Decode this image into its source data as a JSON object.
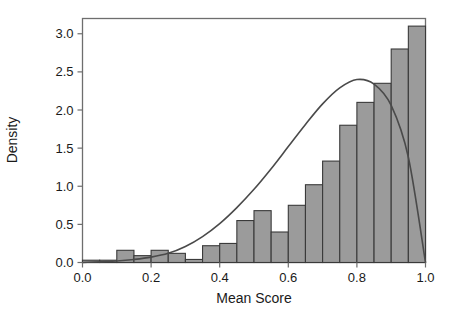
{
  "chart_data": {
    "type": "bar",
    "title": "",
    "subtitle": "",
    "xlabel": "Mean Score",
    "ylabel": "Density",
    "xlim": [
      0.0,
      1.0
    ],
    "ylim": [
      0.0,
      3.2
    ],
    "xticks": [
      0.0,
      0.2,
      0.4,
      0.6,
      0.8,
      1.0
    ],
    "xtick_labels": [
      "0.0",
      "0.2",
      "0.4",
      "0.6",
      "0.8",
      "1.0"
    ],
    "yticks": [
      0.0,
      0.5,
      1.0,
      1.5,
      2.0,
      2.5,
      3.0
    ],
    "ytick_labels": [
      "0.0",
      "0.5",
      "1.0",
      "1.5",
      "2.0",
      "2.5",
      "3.0"
    ],
    "grid": false,
    "legend": "none",
    "bin_width": 0.05,
    "bin_edges": [
      0.0,
      0.05,
      0.1,
      0.15,
      0.2,
      0.25,
      0.3,
      0.35,
      0.4,
      0.45,
      0.5,
      0.55,
      0.6,
      0.65,
      0.7,
      0.75,
      0.8,
      0.85,
      0.9,
      0.95,
      1.0
    ],
    "categories": [
      "0.00-0.05",
      "0.05-0.10",
      "0.10-0.15",
      "0.15-0.20",
      "0.20-0.25",
      "0.25-0.30",
      "0.30-0.35",
      "0.35-0.40",
      "0.40-0.45",
      "0.45-0.50",
      "0.50-0.55",
      "0.55-0.60",
      "0.60-0.65",
      "0.65-0.70",
      "0.70-0.75",
      "0.75-0.80",
      "0.80-0.85",
      "0.85-0.90",
      "0.90-0.95",
      "0.95-1.00"
    ],
    "values": [
      0.03,
      0.03,
      0.16,
      0.09,
      0.16,
      0.12,
      0.04,
      0.22,
      0.25,
      0.55,
      0.68,
      0.4,
      0.75,
      1.02,
      1.33,
      1.8,
      2.1,
      2.35,
      2.8,
      3.1
    ],
    "series": [
      {
        "name": "Histogram",
        "values": [
          0.03,
          0.03,
          0.16,
          0.09,
          0.16,
          0.12,
          0.04,
          0.22,
          0.25,
          0.55,
          0.68,
          0.4,
          0.75,
          1.02,
          1.33,
          1.8,
          2.1,
          2.35,
          2.8,
          3.1
        ]
      }
    ],
    "overlay_curve": {
      "name": "Density estimate",
      "x": [
        0.0,
        0.05,
        0.1,
        0.15,
        0.2,
        0.25,
        0.3,
        0.35,
        0.4,
        0.45,
        0.5,
        0.55,
        0.6,
        0.65,
        0.7,
        0.75,
        0.8,
        0.85,
        0.9,
        0.95,
        1.0
      ],
      "y": [
        0.0,
        0.01,
        0.02,
        0.04,
        0.07,
        0.12,
        0.21,
        0.34,
        0.51,
        0.72,
        0.96,
        1.23,
        1.52,
        1.81,
        2.08,
        2.29,
        2.4,
        2.34,
        2.06,
        1.38,
        0.0
      ]
    },
    "colors": {
      "bar_fill": "#9b9b9b",
      "bar_edge": "#3a3a3a",
      "curve": "#4a4a4a",
      "axis": "#6e6e6e",
      "text": "#1a1a1a",
      "background": "#ffffff"
    }
  }
}
